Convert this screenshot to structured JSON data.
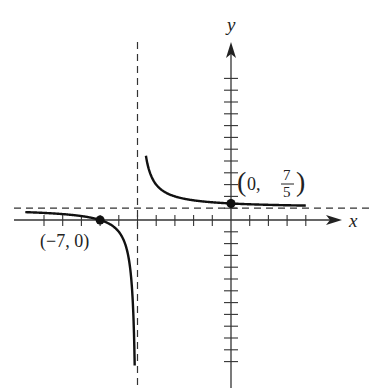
{
  "chart_data": {
    "type": "line",
    "title": "",
    "function": "f(x) = (x + 7) / (x + 5)",
    "xlabel": "x",
    "ylabel": "y",
    "xlim": [
      -11.5,
      6
    ],
    "ylim": [
      -14.5,
      16
    ],
    "x_ticks": [
      -10,
      -9,
      -8,
      -7,
      -6,
      -5,
      -4,
      -3,
      -2,
      -1,
      1,
      2,
      3,
      4
    ],
    "y_ticks": [
      -12,
      -11,
      -10,
      -9,
      -8,
      -7,
      -6,
      -5,
      -4,
      -3,
      -2,
      -1,
      1,
      2,
      3,
      4,
      5,
      6,
      7,
      8,
      9,
      10,
      11,
      12
    ],
    "grid": false,
    "asymptotes": {
      "vertical": -5,
      "horizontal": 1
    },
    "branches": [
      {
        "name": "left branch",
        "x_range": [
          -11,
          -5.15
        ]
      },
      {
        "name": "right branch",
        "x_range": [
          -4.55,
          4
        ]
      }
    ],
    "points": [
      {
        "x": -7,
        "y": 0,
        "label": "(−7, 0)"
      },
      {
        "x": 0,
        "y": 1.4,
        "label_prefix": "(0, ",
        "label_num": "7",
        "label_den": "5",
        "label_suffix": ")"
      }
    ],
    "colors": {
      "curve": "#111111",
      "axis": "#333333",
      "asymptote": "#333333"
    }
  }
}
